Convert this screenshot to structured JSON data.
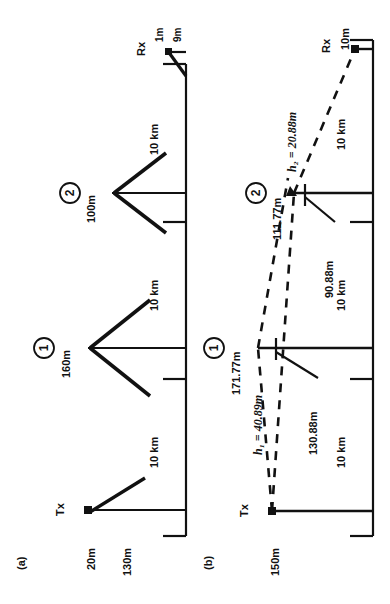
{
  "figure": {
    "caption_a": "(a)",
    "caption_b": "(b)",
    "orientation": "rotated-90-ccw"
  },
  "panel_a": {
    "name": "panel-a",
    "tx_label": "Tx",
    "rx_label": "Rx",
    "tx_heights": [
      "20m",
      "130m"
    ],
    "rx_heights": [
      "1m",
      "9m"
    ],
    "stations": [
      {
        "id": "1",
        "badge": "1",
        "height": "160m"
      },
      {
        "id": "2",
        "badge": "2",
        "height": "100m"
      }
    ],
    "span_labels": [
      "10 km",
      "10 km",
      "10 km"
    ]
  },
  "panel_b": {
    "name": "panel-b",
    "tx_label": "Tx",
    "rx_label": "Rx",
    "tx_height": "150m",
    "rx_height": "10m",
    "stations": [
      {
        "id": "1",
        "badge": "1",
        "top_height": "171.77m",
        "sub_height": "130.88m"
      },
      {
        "id": "2",
        "badge": "2",
        "top_height": "111.77m",
        "sub_height": "90.88m"
      }
    ],
    "effective_heights": [
      {
        "symbol": "h",
        "sub": "1",
        "text": "h₁ = 40.89m"
      },
      {
        "symbol": "h",
        "sub": "2",
        "text": "h₂ = 20.88m"
      }
    ],
    "span_labels": [
      "10 km",
      "10 km",
      "10 km"
    ]
  },
  "colors": {
    "ink": "#111111",
    "background": "#ffffff"
  }
}
